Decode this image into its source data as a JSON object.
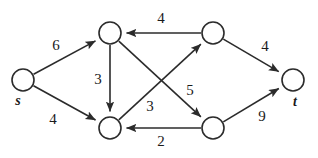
{
  "figure": {
    "background_color": "#ffffff",
    "stroke_color": "#2b2b2b",
    "text_color": "#1a1a1a",
    "width": 318,
    "height": 158
  },
  "chart_data": {
    "type": "diagram",
    "diagram_type": "directed-weighted-graph",
    "title": "",
    "nodes": [
      {
        "id": "s",
        "label": "s",
        "x": 23,
        "y": 80,
        "r": 11,
        "label_x": 18,
        "label_y": 102
      },
      {
        "id": "v1",
        "label": "",
        "x": 110,
        "y": 33,
        "r": 11,
        "label_x": 110,
        "label_y": 33
      },
      {
        "id": "v2",
        "label": "",
        "x": 213,
        "y": 33,
        "r": 11,
        "label_x": 213,
        "label_y": 33
      },
      {
        "id": "v3",
        "label": "",
        "x": 110,
        "y": 128,
        "r": 11,
        "label_x": 110,
        "label_y": 128
      },
      {
        "id": "v4",
        "label": "",
        "x": 213,
        "y": 128,
        "r": 11,
        "label_x": 213,
        "label_y": 128
      },
      {
        "id": "t",
        "label": "t",
        "x": 293,
        "y": 80,
        "r": 11,
        "label_x": 295,
        "label_y": 103
      }
    ],
    "edges": [
      {
        "id": "s-v1",
        "from": "s",
        "to": "v1",
        "weight": "6",
        "label_x": 56,
        "label_y": 47,
        "directed": true
      },
      {
        "id": "s-v3",
        "from": "s",
        "to": "v3",
        "weight": "4",
        "label_x": 53,
        "label_y": 121,
        "directed": true
      },
      {
        "id": "v1-v3",
        "from": "v1",
        "to": "v3",
        "weight": "3",
        "label_x": 98,
        "label_y": 81,
        "directed": true
      },
      {
        "id": "v2-v1",
        "from": "v2",
        "to": "v1",
        "weight": "4",
        "label_x": 161,
        "label_y": 20,
        "directed": true
      },
      {
        "id": "v3-v2",
        "from": "v3",
        "to": "v2",
        "weight": "3",
        "label_x": 150,
        "label_y": 108,
        "directed": true
      },
      {
        "id": "v1-v4",
        "from": "v1",
        "to": "v4",
        "weight": "5",
        "label_x": 190,
        "label_y": 92,
        "directed": true
      },
      {
        "id": "v4-v3",
        "from": "v4",
        "to": "v3",
        "weight": "2",
        "label_x": 161,
        "label_y": 143,
        "directed": true
      },
      {
        "id": "v2-t",
        "from": "v2",
        "to": "t",
        "weight": "4",
        "label_x": 265,
        "label_y": 48,
        "directed": true
      },
      {
        "id": "v4-t",
        "from": "v4",
        "to": "t",
        "weight": "9",
        "label_x": 262,
        "label_y": 118,
        "directed": true
      }
    ],
    "node_labels": [
      "s",
      "t"
    ],
    "edge_weights": [
      "6",
      "4",
      "3",
      "4",
      "3",
      "5",
      "2",
      "4",
      "9"
    ]
  }
}
